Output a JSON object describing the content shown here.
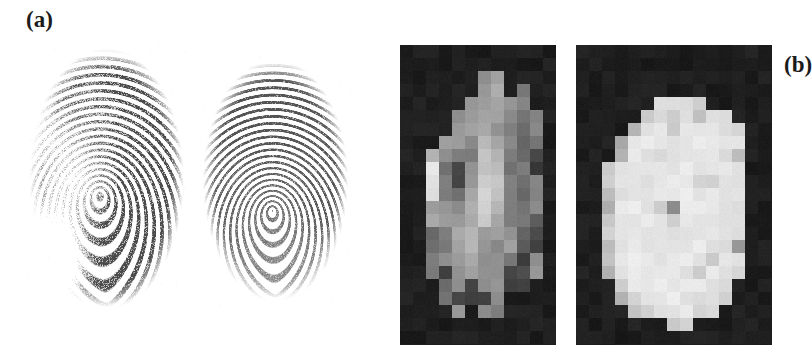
{
  "figure": {
    "background_color": "#ffffff",
    "caption_font_color": "#1b1b1b",
    "panels": [
      {
        "id": "a",
        "label": "(a)",
        "kind": "fingerprint-pair"
      },
      {
        "id": "b",
        "label": "(b)",
        "kind": "pixelated-pair"
      }
    ]
  },
  "panel_a": {
    "label": "(a)",
    "images": [
      {
        "name": "fingerprint-left",
        "description": "noisy smudged latent fingerprint, loop pattern",
        "ink_color": "#3a3a3a",
        "ridge_count": 30,
        "quality": "low",
        "core_x": 0.46,
        "core_y": 0.56
      },
      {
        "name": "fingerprint-right",
        "description": "clean rolled fingerprint, loop pattern",
        "ink_color": "#4a4a4a",
        "ridge_count": 32,
        "quality": "high",
        "core_x": 0.48,
        "core_y": 0.62
      }
    ]
  },
  "panel_b": {
    "label": "(b)",
    "background_color": "#141414",
    "cell_size": 13,
    "images": [
      {
        "name": "pixel-map-left",
        "description": "low-resolution blocky grayscale map, high contrast, noisy",
        "cols": 12,
        "rows": 23,
        "offset_x": 0,
        "offset_y": 0,
        "values": [
          [
            0,
            0,
            0,
            0,
            0,
            0,
            0,
            0,
            0,
            0,
            0,
            0
          ],
          [
            0,
            0,
            0,
            0,
            0,
            0,
            0,
            0,
            0,
            0,
            0,
            0
          ],
          [
            0,
            0,
            0,
            0,
            0,
            0,
            146,
            168,
            0,
            0,
            0,
            0
          ],
          [
            0,
            0,
            0,
            0,
            0,
            0,
            150,
            175,
            0,
            120,
            0,
            0
          ],
          [
            0,
            0,
            0,
            0,
            0,
            155,
            160,
            168,
            150,
            128,
            0,
            0
          ],
          [
            0,
            0,
            0,
            0,
            148,
            152,
            170,
            162,
            140,
            120,
            130,
            0
          ],
          [
            0,
            0,
            0,
            0,
            150,
            168,
            178,
            150,
            128,
            110,
            142,
            0
          ],
          [
            0,
            0,
            0,
            160,
            152,
            138,
            190,
            170,
            132,
            95,
            120,
            0
          ],
          [
            0,
            0,
            178,
            148,
            128,
            118,
            200,
            186,
            120,
            105,
            60,
            0
          ],
          [
            0,
            0,
            236,
            110,
            72,
            146,
            205,
            196,
            118,
            128,
            52,
            0
          ],
          [
            0,
            0,
            240,
            122,
            66,
            160,
            212,
            200,
            124,
            110,
            135,
            0
          ],
          [
            0,
            0,
            228,
            120,
            110,
            168,
            218,
            198,
            130,
            96,
            128,
            0
          ],
          [
            0,
            0,
            162,
            150,
            142,
            176,
            222,
            190,
            126,
            118,
            142,
            0
          ],
          [
            0,
            0,
            168,
            158,
            150,
            180,
            210,
            175,
            132,
            126,
            90,
            0
          ],
          [
            0,
            0,
            100,
            120,
            168,
            188,
            165,
            160,
            150,
            105,
            75,
            0
          ],
          [
            0,
            0,
            104,
            118,
            170,
            182,
            150,
            142,
            158,
            88,
            55,
            0
          ],
          [
            0,
            0,
            128,
            150,
            155,
            168,
            146,
            150,
            120,
            60,
            138,
            0
          ],
          [
            0,
            0,
            120,
            60,
            148,
            158,
            152,
            148,
            60,
            70,
            150,
            0
          ],
          [
            0,
            0,
            0,
            112,
            146,
            60,
            140,
            150,
            62,
            60,
            0,
            0
          ],
          [
            0,
            0,
            0,
            118,
            72,
            60,
            60,
            145,
            0,
            0,
            0,
            0
          ],
          [
            0,
            0,
            0,
            0,
            150,
            0,
            140,
            128,
            0,
            0,
            0,
            0
          ],
          [
            0,
            0,
            0,
            0,
            0,
            0,
            0,
            0,
            0,
            0,
            0,
            0
          ],
          [
            0,
            0,
            0,
            0,
            0,
            0,
            0,
            0,
            0,
            0,
            0,
            0
          ]
        ]
      },
      {
        "name": "pixel-map-right",
        "description": "low-resolution blocky grayscale map, bright and uniform",
        "cols": 15,
        "rows": 23,
        "offset_x": 0,
        "offset_y": 0,
        "values": [
          [
            0,
            0,
            0,
            0,
            0,
            0,
            0,
            0,
            0,
            0,
            0,
            0,
            0,
            0,
            0
          ],
          [
            0,
            0,
            0,
            0,
            0,
            0,
            0,
            0,
            0,
            0,
            0,
            0,
            0,
            0,
            0
          ],
          [
            0,
            0,
            0,
            0,
            0,
            0,
            0,
            0,
            0,
            0,
            0,
            0,
            0,
            0,
            0
          ],
          [
            0,
            0,
            0,
            0,
            0,
            0,
            0,
            0,
            0,
            0,
            0,
            0,
            0,
            0,
            0
          ],
          [
            0,
            0,
            0,
            0,
            0,
            0,
            228,
            232,
            225,
            210,
            0,
            0,
            0,
            0,
            0
          ],
          [
            0,
            0,
            0,
            0,
            0,
            215,
            232,
            205,
            236,
            202,
            228,
            232,
            0,
            0,
            0
          ],
          [
            0,
            0,
            0,
            0,
            185,
            238,
            240,
            214,
            242,
            238,
            236,
            230,
            225,
            0,
            0
          ],
          [
            0,
            0,
            0,
            175,
            235,
            240,
            238,
            236,
            240,
            242,
            238,
            234,
            232,
            0,
            0
          ],
          [
            0,
            0,
            0,
            180,
            240,
            238,
            228,
            234,
            242,
            240,
            236,
            230,
            195,
            0,
            0
          ],
          [
            0,
            0,
            205,
            238,
            242,
            240,
            236,
            240,
            244,
            238,
            232,
            236,
            228,
            0,
            0
          ],
          [
            0,
            0,
            210,
            240,
            236,
            232,
            238,
            242,
            240,
            222,
            218,
            238,
            232,
            0,
            0
          ],
          [
            0,
            0,
            198,
            236,
            240,
            238,
            244,
            240,
            242,
            238,
            236,
            234,
            230,
            0,
            0
          ],
          [
            0,
            0,
            185,
            238,
            242,
            236,
            215,
            148,
            238,
            240,
            238,
            236,
            228,
            0,
            0
          ],
          [
            0,
            0,
            205,
            240,
            238,
            242,
            240,
            212,
            236,
            242,
            240,
            232,
            230,
            0,
            0
          ],
          [
            0,
            0,
            212,
            236,
            240,
            238,
            242,
            238,
            240,
            236,
            238,
            240,
            226,
            0,
            0
          ],
          [
            0,
            0,
            196,
            240,
            238,
            236,
            240,
            242,
            238,
            240,
            236,
            228,
            150,
            0,
            0
          ],
          [
            0,
            0,
            205,
            238,
            242,
            240,
            236,
            238,
            242,
            238,
            215,
            232,
            228,
            0,
            0
          ],
          [
            0,
            0,
            180,
            236,
            240,
            238,
            242,
            240,
            236,
            218,
            240,
            238,
            218,
            0,
            0
          ],
          [
            0,
            0,
            0,
            205,
            238,
            242,
            240,
            236,
            238,
            240,
            236,
            228,
            0,
            0,
            0
          ],
          [
            0,
            0,
            0,
            180,
            218,
            236,
            240,
            242,
            238,
            232,
            228,
            215,
            0,
            0,
            0
          ],
          [
            0,
            0,
            0,
            0,
            200,
            215,
            238,
            236,
            240,
            225,
            218,
            0,
            0,
            0,
            0
          ],
          [
            0,
            0,
            0,
            0,
            0,
            0,
            0,
            210,
            218,
            0,
            0,
            0,
            0,
            0,
            0
          ],
          [
            0,
            0,
            0,
            0,
            0,
            0,
            0,
            0,
            0,
            0,
            0,
            0,
            0,
            0,
            0
          ]
        ]
      }
    ]
  }
}
